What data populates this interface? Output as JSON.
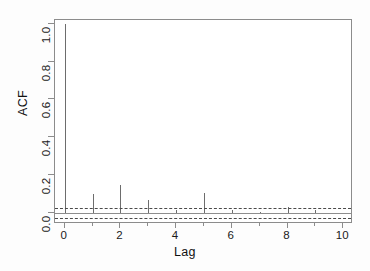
{
  "chart_data": {
    "type": "bar",
    "title": "",
    "subtitle": "",
    "xlabel": "Lag",
    "ylabel": "ACF",
    "x": [
      0,
      1,
      2,
      3,
      4,
      5,
      6,
      7,
      8,
      9,
      10
    ],
    "values": [
      1.0,
      0.1,
      0.145,
      0.065,
      0.015,
      0.105,
      0.012,
      0.005,
      0.028,
      0.013,
      0.0
    ],
    "categories": [
      "0",
      "1",
      "2",
      "3",
      "4",
      "5",
      "6",
      "7",
      "8",
      "9",
      "10"
    ],
    "series": [
      {
        "name": "ACF",
        "values": [
          1.0,
          0.1,
          0.145,
          0.065,
          0.015,
          0.105,
          0.012,
          0.005,
          0.028,
          0.013,
          0.0
        ]
      }
    ],
    "xlim": [
      -0.35,
      10.35
    ],
    "ylim": [
      -0.06,
      1.02
    ],
    "grid": false,
    "legend": null,
    "annotations": [
      {
        "name": "zero-line",
        "value": 0.0,
        "style": "solid"
      },
      {
        "name": "confidence-upper",
        "value": 0.027,
        "style": "dashed"
      },
      {
        "name": "confidence-lower",
        "value": -0.027,
        "style": "dashed"
      }
    ],
    "y_ticks": [
      {
        "value": 1.0,
        "label": "1.0"
      },
      {
        "value": 0.8,
        "label": "0.8"
      },
      {
        "value": 0.6,
        "label": "0.6"
      },
      {
        "value": 0.4,
        "label": "0.4"
      },
      {
        "value": 0.2,
        "label": "0.2"
      },
      {
        "value": 0.0,
        "label": "0.0"
      }
    ],
    "x_ticks": [
      {
        "value": 0,
        "label": "0",
        "major": true
      },
      {
        "value": 1,
        "label": "",
        "major": false
      },
      {
        "value": 2,
        "label": "2",
        "major": true
      },
      {
        "value": 3,
        "label": "",
        "major": false
      },
      {
        "value": 4,
        "label": "4",
        "major": true
      },
      {
        "value": 5,
        "label": "",
        "major": false
      },
      {
        "value": 6,
        "label": "6",
        "major": true
      },
      {
        "value": 7,
        "label": "",
        "major": false
      },
      {
        "value": 8,
        "label": "8",
        "major": true
      },
      {
        "value": 9,
        "label": "",
        "major": false
      },
      {
        "value": 10,
        "label": "10",
        "major": true
      }
    ],
    "colors": {
      "spike": "#6d6d6d",
      "frame": "#8c8c8c",
      "zero_line": "#8d8d8d",
      "confidence": "#4a4a4a",
      "text": "#1a1a1a",
      "background": "#ffffff"
    }
  }
}
